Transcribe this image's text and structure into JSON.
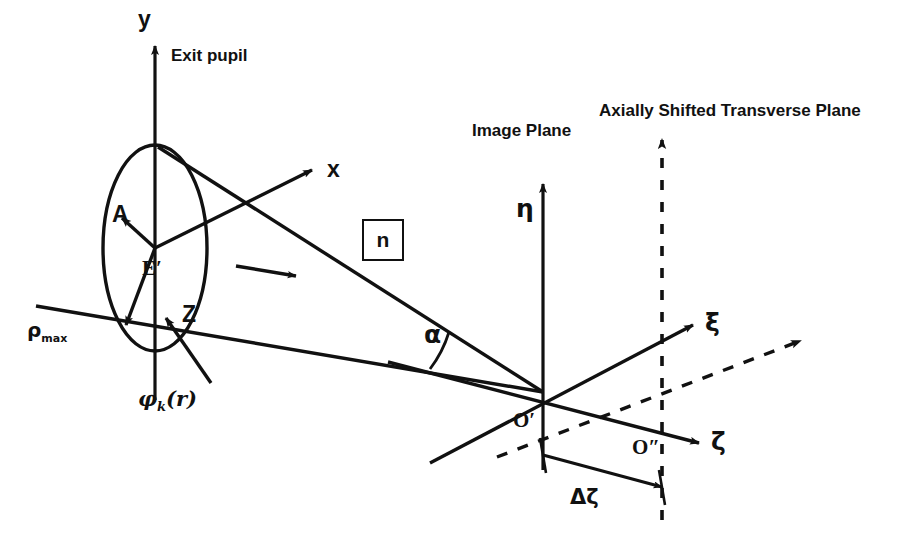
{
  "figure": {
    "background_color": "#ffffff",
    "ink_color": "#111111",
    "width": 904,
    "height": 558
  },
  "labels": {
    "y_axis": "y",
    "x_axis": "x",
    "z_axis": "Z",
    "exit_pupil": "Exit pupil",
    "pupil_center": "E′",
    "amplitude_vector": "A",
    "rho_max": "ρ",
    "rho_max_sub": "max",
    "phase_function": "φ",
    "phase_function_sub": "k",
    "phase_function_arg": "(r)",
    "refractive_index": "n",
    "alpha_angle": "α",
    "image_plane": "Image Plane",
    "eta_axis": "η",
    "xi_axis": "ξ",
    "zeta_axis": "ζ",
    "image_origin": "O′",
    "shifted_origin": "O″",
    "delta_zeta": "Δζ",
    "shifted_plane": "Axially Shifted Transverse Plane"
  },
  "geometry": {
    "pupil_center": [
      155,
      248
    ],
    "image_origin": [
      543,
      392
    ],
    "shifted_origin": [
      662,
      421
    ],
    "pupil_ellipse_rx": 52,
    "pupil_ellipse_ry": 103
  }
}
